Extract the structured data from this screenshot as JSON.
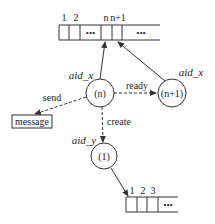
{
  "diagram": {
    "top_array": {
      "index_labels": [
        "1",
        "2",
        "n",
        "n+1"
      ],
      "ellipsis_1": "•••",
      "ellipsis_2": "•••"
    },
    "bottom_array": {
      "index_labels": [
        "1",
        "2",
        "3"
      ],
      "ellipsis": "•••"
    },
    "nodes": {
      "n": {
        "label": "(n)",
        "actor": "aid_x"
      },
      "n_plus_1": {
        "label": "(n+1)",
        "actor": "aid_x"
      },
      "one": {
        "label": "(1)",
        "actor": "aid_y"
      }
    },
    "edges": {
      "send": "send",
      "ready": "ready",
      "create": "create"
    },
    "message_box": "message",
    "colors": {
      "stroke": "#333333",
      "text": "#222222",
      "background": "#ffffff"
    }
  }
}
